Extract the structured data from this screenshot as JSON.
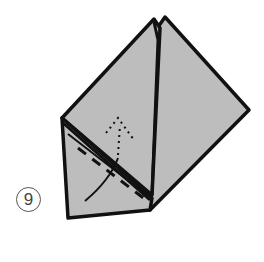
{
  "diagram": {
    "step_number": "9",
    "colors": {
      "paper": "#bdbdbd",
      "outline": "#111111",
      "background": "#ffffff",
      "badge_border": "#555555"
    },
    "annotations": [
      {
        "type": "fold-arrow",
        "style": "dotted",
        "direction": "up",
        "meaning": "fold flap upward"
      },
      {
        "type": "guide-curve",
        "style": "solid"
      }
    ]
  }
}
